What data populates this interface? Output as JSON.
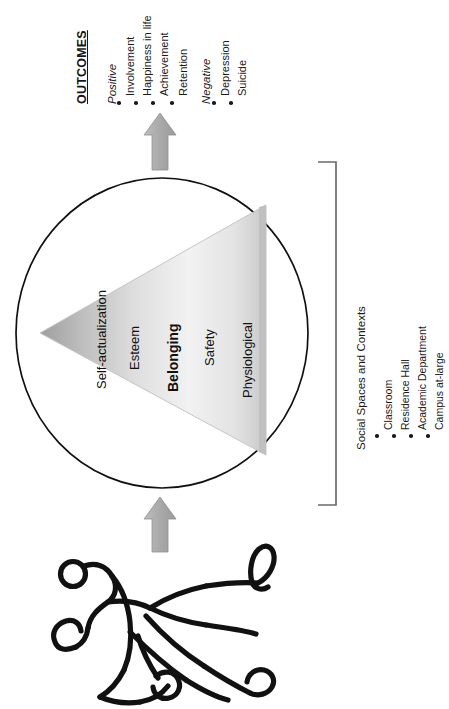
{
  "diagram": {
    "orientation": "rotated-90-ccw"
  },
  "outcomes": {
    "heading": "OUTCOMES",
    "groups": [
      {
        "label": "Positive",
        "items": [
          "Involvement",
          "Happiness in life",
          "Achievement",
          "Retention"
        ]
      },
      {
        "label": "Negative",
        "items": [
          "Depression",
          "Suicide"
        ]
      }
    ]
  },
  "pyramid": {
    "levels": [
      {
        "name": "Self-actualization",
        "emphasis": false
      },
      {
        "name": "Esteem",
        "emphasis": false
      },
      {
        "name": "Belonging",
        "emphasis": true
      },
      {
        "name": "Safety",
        "emphasis": false
      },
      {
        "name": "Physiological",
        "emphasis": false
      }
    ]
  },
  "context": {
    "title": "Social Spaces and Contexts",
    "items": [
      "Classroom",
      "Residence Hall",
      "Academic Department",
      "Campus at-large"
    ]
  },
  "figure": {
    "name": "running-person"
  },
  "arrows": [
    {
      "name": "arrow-person-to-circle",
      "direction": "up"
    },
    {
      "name": "arrow-circle-to-outcomes",
      "direction": "up"
    }
  ],
  "colors": {
    "ink": "#111111",
    "arrow_fill": "#ababab",
    "arrow_stroke": "#8f8f8f",
    "pyramid_apex": "#a2a2a2",
    "pyramid_mid": "#d9d9d9",
    "pyramid_base": "#f4f4f4",
    "pyramid_edge": "#bdbdbd",
    "bracket": "#555555",
    "background": "#ffffff"
  }
}
